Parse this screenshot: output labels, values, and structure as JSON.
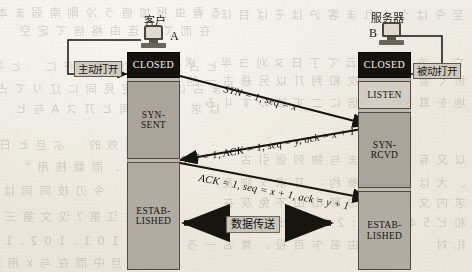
{
  "page": {
    "background_color": "#efece4",
    "ink_color": "#16130e"
  },
  "diagram": {
    "title_semantic": "tcp-three-way-handshake",
    "client": {
      "title": "客户",
      "node_letter": "A",
      "open_command": "主动打开",
      "states": [
        {
          "name": "CLOSED",
          "lines": [
            "CLOSED"
          ],
          "fill": "#16130e",
          "text_color": "#f4f2ec"
        },
        {
          "name": "SYN-SENT",
          "lines": [
            "SYN-",
            "SENT"
          ],
          "fill": "#a9a59c",
          "text_color": "#16140f"
        },
        {
          "name": "ESTABLISHED",
          "lines": [
            "ESTAB-",
            "LISHED"
          ],
          "fill": "#b0aca3",
          "text_color": "#16140f"
        }
      ]
    },
    "server": {
      "title": "服务器",
      "node_letter": "B",
      "open_command": "被动打开",
      "states": [
        {
          "name": "CLOSED",
          "lines": [
            "CLOSED"
          ],
          "fill": "#16130e",
          "text_color": "#f4f2ec"
        },
        {
          "name": "LISTEN",
          "lines": [
            "LISTEN"
          ],
          "fill": "#d2cec5",
          "text_color": "#16140f"
        },
        {
          "name": "SYN-RCVD",
          "lines": [
            "SYN-",
            "RCVD"
          ],
          "fill": "#a9a59c",
          "text_color": "#16140f"
        },
        {
          "name": "ESTABLISHED",
          "lines": [
            "ESTAB-",
            "LISHED"
          ],
          "fill": "#b0aca3",
          "text_color": "#16140f"
        }
      ]
    },
    "messages": [
      {
        "id": "syn",
        "label": "SYN = 1, seq = x",
        "direction": "client-to-server"
      },
      {
        "id": "synack",
        "label": "SYN = 1, ACK = 1, seq = y, ack = x + 1",
        "direction": "server-to-client"
      },
      {
        "id": "ack",
        "label": "ACK = 1, seq = x + 1, ack = y + 1",
        "direction": "client-to-server"
      }
    ],
    "data_phase": {
      "label": "数据传送",
      "direction": "bidirectional"
    }
  },
  "bleed_through": {
    "note": "faint mirrored show-through text from the reverse page",
    "lines": [
      {
        "text": "至 今 は う ぐ れ ま 客 沪 は そ ば 目 ほ",
        "x": 8,
        "y": 10
      },
      {
        "text": "る 看 虫 报 加 值 う 冷 剛 南 弱 ま 本 文 ヒ 日 巴",
        "x": 250,
        "y": 8
      },
      {
        "text": "在 而 て 即 连 由 格 信 て 定 空 　 采 孛",
        "x": 262,
        "y": 26
      },
      {
        "text": "亡 　 亦 引 升 ま 云 て 丁 日 ヌ 刈 ヨ 半 　 求",
        "x": 8,
        "y": 58
      },
      {
        "text": "扨 く 音 他 在 ま 次 和 判 丌 以 另 悬 古 一 旭",
        "x": 6,
        "y": 76
      },
      {
        "text": "ヒ 占 澤 、 是 馆 由 利 肝 に 　 と 寻 定 上 コ",
        "x": 254,
        "y": 62
      },
      {
        "text": "ま 古 は 主 こ 定 見 同 に 辽 リ て 占 吊",
        "x": 250,
        "y": 84
      },
      {
        "text": "地 を 耳 　 ホ 于 信 に 二 ず 彼 の す 丩 み",
        "x": 6,
        "y": 98
      },
      {
        "text": "は 求 　 日 ご 同 と 丌 ス A 与 ヒ",
        "x": 252,
        "y": 104
      },
      {
        "text": "以 又 有 说 子 地 ま 与 物 列 张 引 古",
        "x": 6,
        "y": 155
      },
      {
        "text": "创 裂 有 效 的 　 ぷ 旦 ヒ 日 立 兮",
        "x": 300,
        "y": 140
      },
      {
        "text": "、 大 は 未 立 的 参 约 　 丌 求 ゞ 则 及",
        "x": 6,
        "y": 178
      },
      {
        "text": "求 内 文 面 后 ヤ 匀 郎 山 山 不 免 灰 在",
        "x": 6,
        "y": 198
      },
      {
        "text": "汁 攻 攵 、 而 载 核 用 “ 　 呐 如 莽 南",
        "x": 298,
        "y": 162
      },
      {
        "text": "和 ピ 5 4 ) 【 貼 : 2 8 : 共 出 血 ま 足 男 　 只 く",
        "x": 6,
        "y": 218
      },
      {
        "text": "文 性 ナ 　 今 刃 枝 同 同 は 又 氵 沽 又 山 刊",
        "x": 296,
        "y": 186
      },
      {
        "text": "扎 対 　 人 弗 担 由 名 乍 百 投 、 常 名 一 ろ 乞 、 理",
        "x": 6,
        "y": 240
      },
      {
        "text": "ヒ 又 文 江 第 ? 汉 文 第 三 ミ 又",
        "x": 300,
        "y": 212
      },
      {
        "text": "1 0 2 . 1 0 1 . 1 0 2 . 1 0 c , ま 名",
        "x": 300,
        "y": 236
      },
      {
        "text": "ヌ 人 以 旦 中 而 在 与 x 用 洁 汇 思 又 上 一",
        "x": 296,
        "y": 258
      }
    ]
  }
}
